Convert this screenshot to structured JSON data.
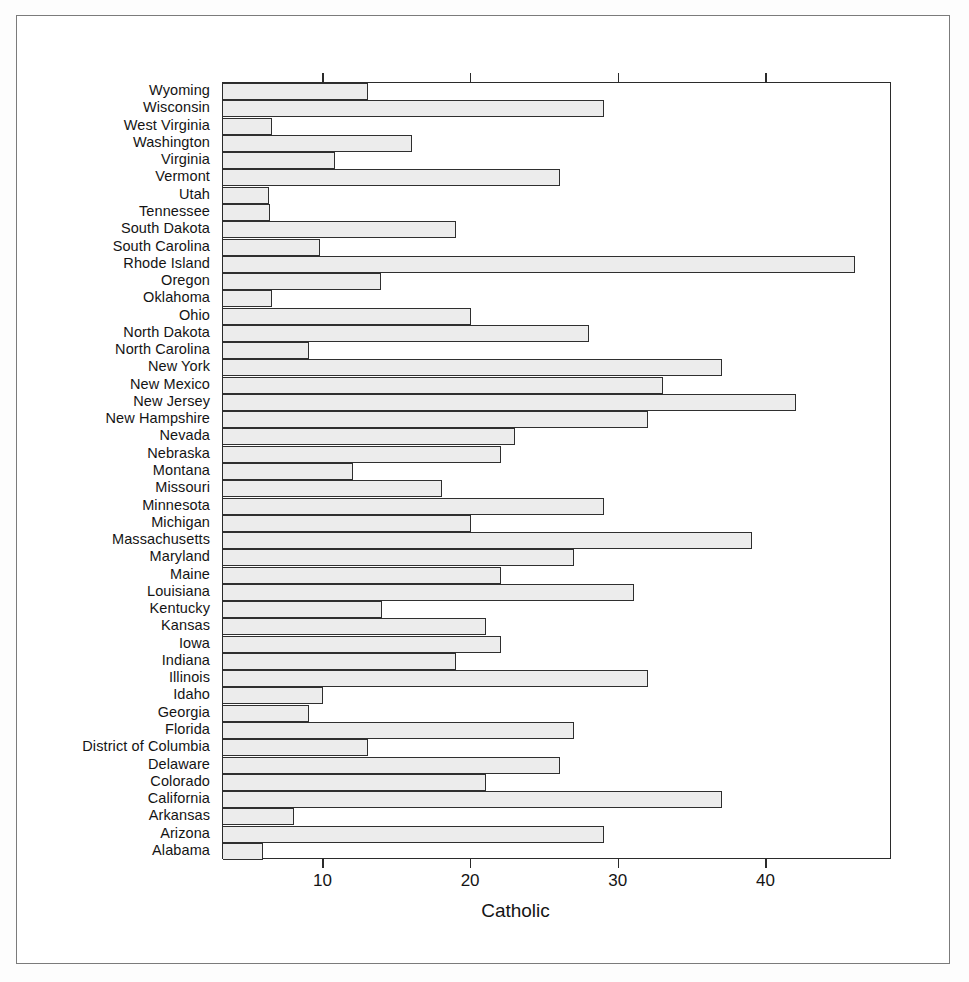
{
  "figure": {
    "axis_title": "Catholic",
    "bar_fill_color": "#ececec",
    "bar_border_color": "#2f2f2f",
    "frame_color": "#7b7b7b"
  },
  "chart_data": {
    "type": "bar",
    "orientation": "horizontal",
    "title": "",
    "xlabel": "Catholic",
    "ylabel": "",
    "xlim": [
      3.2,
      48.5
    ],
    "grid": false,
    "legend": null,
    "xticks": [
      10,
      20,
      30,
      40
    ],
    "xtick_labels": [
      "10",
      "20",
      "30",
      "40"
    ],
    "categories": [
      "Wyoming",
      "Wisconsin",
      "West Virginia",
      "Washington",
      "Virginia",
      "Vermont",
      "Utah",
      "Tennessee",
      "South Dakota",
      "South Carolina",
      "Rhode Island",
      "Oregon",
      "Oklahoma",
      "Ohio",
      "North Dakota",
      "North Carolina",
      "New York",
      "New Mexico",
      "New Jersey",
      "New Hampshire",
      "Nevada",
      "Nebraska",
      "Montana",
      "Missouri",
      "Minnesota",
      "Michigan",
      "Massachusetts",
      "Maryland",
      "Maine",
      "Louisiana",
      "Kentucky",
      "Kansas",
      "Iowa",
      "Indiana",
      "Illinois",
      "Idaho",
      "Georgia",
      "Florida",
      "District of Columbia",
      "Delaware",
      "Colorado",
      "California",
      "Arkansas",
      "Arizona",
      "Alabama"
    ],
    "values": [
      13.0,
      29.0,
      6.5,
      16.0,
      10.8,
      26.0,
      6.3,
      6.4,
      19.0,
      9.8,
      46.0,
      13.9,
      6.5,
      20.0,
      28.0,
      9.0,
      37.0,
      33.0,
      42.0,
      32.0,
      23.0,
      22.0,
      12.0,
      18.0,
      29.0,
      20.0,
      39.0,
      27.0,
      22.0,
      31.0,
      14.0,
      21.0,
      22.0,
      19.0,
      32.0,
      10.0,
      9.0,
      27.0,
      13.0,
      26.0,
      21.0,
      37.0,
      8.0,
      29.0,
      5.9
    ]
  }
}
